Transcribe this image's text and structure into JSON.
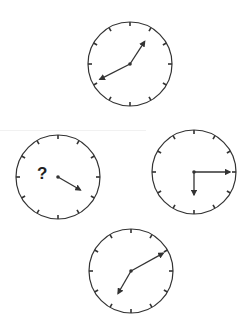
{
  "puzzle": {
    "type": "clock-sequence",
    "question_symbol": "?",
    "colors": {
      "stroke": "#333333",
      "background": "#ffffff"
    },
    "clocks": [
      {
        "id": "top",
        "cx": 130,
        "cy": 64,
        "r": 42,
        "hands": [
          {
            "kind": "hour",
            "angle": 33,
            "length": 27
          },
          {
            "kind": "minute",
            "angle": 243,
            "length": 34
          }
        ],
        "reading": "1:40"
      },
      {
        "id": "left",
        "cx": 58,
        "cy": 177,
        "r": 42,
        "hands": [
          {
            "kind": "minute",
            "angle": 120,
            "length": 26
          }
        ],
        "missing": "hour",
        "reading": "?:20"
      },
      {
        "id": "right",
        "cx": 194,
        "cy": 172,
        "r": 42,
        "hands": [
          {
            "kind": "minute",
            "angle": 90,
            "length": 36
          },
          {
            "kind": "hour",
            "angle": 180,
            "length": 23
          }
        ],
        "reading": "6:15"
      },
      {
        "id": "bottom",
        "cx": 131,
        "cy": 271,
        "r": 42,
        "hands": [
          {
            "kind": "minute",
            "angle": 61,
            "length": 37
          },
          {
            "kind": "hour",
            "angle": 210,
            "length": 26
          }
        ],
        "reading": "7:10"
      }
    ]
  }
}
